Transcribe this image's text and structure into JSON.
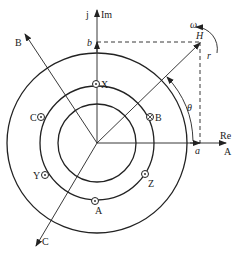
{
  "diagram": {
    "axes": {
      "real_label": "Re",
      "imag_label": "Im",
      "imag_unit": "j"
    },
    "phase_axes": {
      "A": "A",
      "B": "B",
      "C": "C"
    },
    "vector": {
      "label": "H",
      "real_projection": "a",
      "imag_projection": "b",
      "angle": "θ",
      "rotation_speed": "ω",
      "magnitude": "r"
    },
    "conductors": [
      {
        "label": "X",
        "symbol": "dot"
      },
      {
        "label": "B",
        "symbol": "cross"
      },
      {
        "label": "Z",
        "symbol": "dot"
      },
      {
        "label": "A",
        "symbol": "dot"
      },
      {
        "label": "Y",
        "symbol": "dot"
      },
      {
        "label": "C",
        "symbol": "dot"
      }
    ],
    "colors": {
      "line": "#222222",
      "background": "#ffffff"
    }
  }
}
